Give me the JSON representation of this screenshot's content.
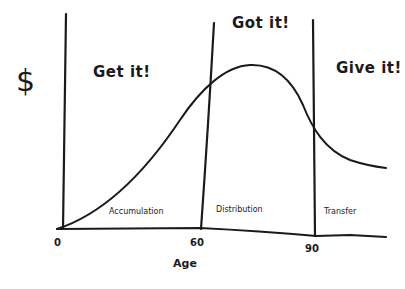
{
  "diagram": {
    "y_axis_label": "$",
    "x_axis_label": "Age",
    "x_ticks": [
      "0",
      "60",
      "90"
    ],
    "phases": [
      {
        "heading": "Get it!",
        "region_label": "Accumulation"
      },
      {
        "heading": "Got it!",
        "region_label": "Distribution"
      },
      {
        "heading": "Give it!",
        "region_label": "Transfer"
      }
    ],
    "colors": {
      "ink": "#1a1a1a",
      "background": "#ffffff"
    }
  }
}
